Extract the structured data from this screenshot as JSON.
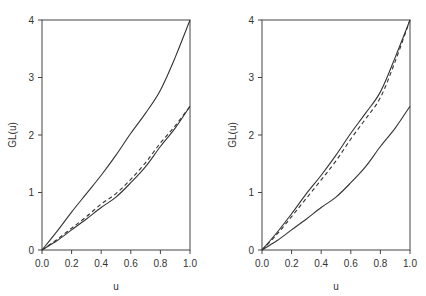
{
  "chart_data": [
    {
      "type": "line",
      "panel": "left",
      "title": "",
      "xlabel": "u",
      "ylabel": "GL(u)",
      "xlim": [
        0,
        1
      ],
      "ylim": [
        0,
        4
      ],
      "xticks": [
        "0.0",
        "0.2",
        "0.4",
        "0.6",
        "0.8",
        "1.0"
      ],
      "yticks": [
        "0",
        "1",
        "2",
        "3",
        "4"
      ],
      "grid": false,
      "x": [
        0,
        0.1,
        0.2,
        0.3,
        0.4,
        0.5,
        0.6,
        0.7,
        0.8,
        0.9,
        1.0
      ],
      "series": [
        {
          "name": "upper solid",
          "style": "solid",
          "values": [
            0,
            0.32,
            0.66,
            0.98,
            1.3,
            1.65,
            2.03,
            2.38,
            2.78,
            3.35,
            4.0
          ]
        },
        {
          "name": "lower solid",
          "style": "solid",
          "values": [
            0,
            0.16,
            0.35,
            0.54,
            0.74,
            0.92,
            1.17,
            1.45,
            1.8,
            2.12,
            2.5
          ]
        },
        {
          "name": "dashed",
          "style": "dashed",
          "values": [
            0,
            0.18,
            0.38,
            0.58,
            0.8,
            0.98,
            1.23,
            1.52,
            1.86,
            2.16,
            2.5
          ]
        }
      ]
    },
    {
      "type": "line",
      "panel": "right",
      "title": "",
      "xlabel": "u",
      "ylabel": "GL(u)",
      "xlim": [
        0,
        1
      ],
      "ylim": [
        0,
        4
      ],
      "xticks": [
        "0.0",
        "0.2",
        "0.4",
        "0.6",
        "0.8",
        "1.0"
      ],
      "yticks": [
        "0",
        "1",
        "2",
        "3",
        "4"
      ],
      "grid": false,
      "x": [
        0,
        0.1,
        0.2,
        0.3,
        0.4,
        0.5,
        0.6,
        0.7,
        0.8,
        0.9,
        1.0
      ],
      "series": [
        {
          "name": "upper solid",
          "style": "solid",
          "values": [
            0,
            0.3,
            0.63,
            0.98,
            1.3,
            1.65,
            2.03,
            2.38,
            2.75,
            3.35,
            4.0
          ]
        },
        {
          "name": "dashed",
          "style": "dashed",
          "values": [
            0,
            0.27,
            0.58,
            0.9,
            1.22,
            1.55,
            1.93,
            2.28,
            2.65,
            3.28,
            4.0
          ]
        },
        {
          "name": "lower solid",
          "style": "solid",
          "values": [
            0,
            0.16,
            0.35,
            0.54,
            0.74,
            0.92,
            1.17,
            1.45,
            1.8,
            2.12,
            2.5
          ]
        }
      ]
    }
  ]
}
